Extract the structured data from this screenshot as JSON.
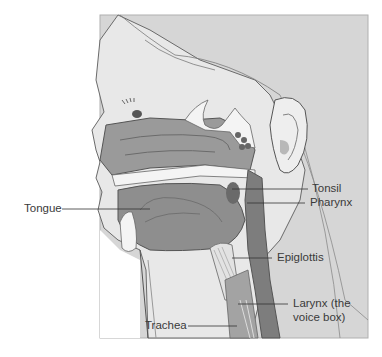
{
  "diagram": {
    "colors": {
      "background_panel": "#d6d6d6",
      "skin": "#e8e8e8",
      "cavity": "#9a9a9a",
      "tissue_dark": "#7d7d7d",
      "bone": "#f4f4f4",
      "outline": "#555555",
      "label_text": "#3a3a3a",
      "leader_line": "#333333"
    },
    "labels": [
      {
        "id": "tonsil",
        "text": "Tonsil"
      },
      {
        "id": "pharynx",
        "text": "Pharynx"
      },
      {
        "id": "tongue",
        "text": "Tongue"
      },
      {
        "id": "epiglottis",
        "text": "Epiglottis"
      },
      {
        "id": "larynx",
        "text": "Larynx (the",
        "text2": "voice box)"
      },
      {
        "id": "trachea",
        "text": "Trachea"
      }
    ]
  }
}
